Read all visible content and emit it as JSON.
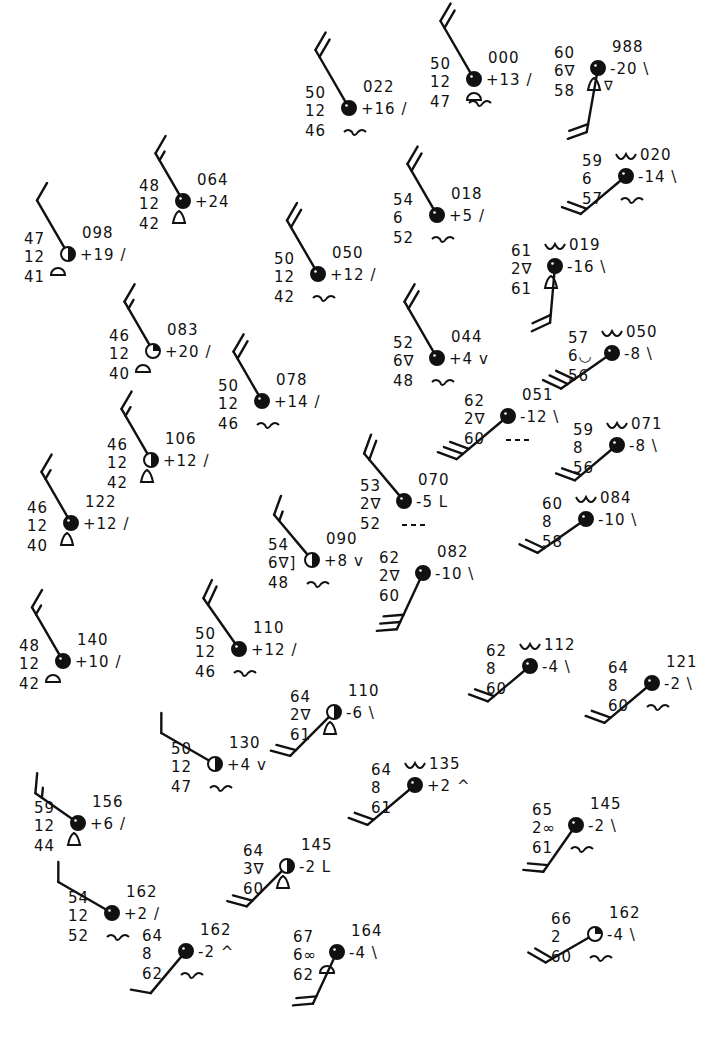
{
  "figure": {
    "type": "surface-station-plot"
  },
  "stations": [
    {
      "id": "s1",
      "x": 349,
      "y": 108,
      "temp": "50",
      "vis": "12",
      "dew": "46",
      "pres": "022",
      "tend": "+16",
      "tsym": "/",
      "cover": "full",
      "wind": {
        "dir": 330,
        "len": 60,
        "barbs": [
          1,
          1
        ]
      },
      "wx": "",
      "low": "wave",
      "mid": ""
    },
    {
      "id": "s2",
      "x": 474,
      "y": 79,
      "temp": "50",
      "vis": "12",
      "dew": "47",
      "pres": "000",
      "tend": "+13",
      "tsym": "/",
      "cover": "full",
      "wind": {
        "dir": 330,
        "len": 60,
        "barbs": [
          1,
          1
        ]
      },
      "wx": "",
      "low": "wave",
      "mid": "dome"
    },
    {
      "id": "s3",
      "x": 598,
      "y": 68,
      "temp": "60",
      "vis": "6∇",
      "dew": "58",
      "pres": "988",
      "tend": "-20",
      "tsym": "\\",
      "cover": "full",
      "wind": {
        "dir": 190,
        "len": 58,
        "barbs": [
          1,
          1
        ]
      },
      "wx": "",
      "low": "",
      "mid": "bell-drop"
    },
    {
      "id": "s4",
      "x": 183,
      "y": 201,
      "temp": "48",
      "vis": "12",
      "dew": "42",
      "pres": "064",
      "tend": "+24",
      "tsym": "",
      "cover": "threequarter",
      "wind": {
        "dir": 330,
        "len": 48,
        "barbs": [
          1,
          0.5
        ]
      },
      "wx": "",
      "low": "",
      "mid": "bell"
    },
    {
      "id": "s5",
      "x": 68,
      "y": 254,
      "temp": "47",
      "vis": "12",
      "dew": "41",
      "pres": "098",
      "tend": "+19",
      "tsym": "/",
      "cover": "half",
      "wind": {
        "dir": 330,
        "len": 55,
        "barbs": [
          1
        ]
      },
      "wx": "",
      "low": "",
      "mid": "dome-l"
    },
    {
      "id": "s6",
      "x": 437,
      "y": 215,
      "temp": "54",
      "vis": "6",
      "dew": "52",
      "pres": "018",
      "tend": "+5",
      "tsym": "/",
      "cover": "full",
      "wind": {
        "dir": 330,
        "len": 52,
        "barbs": [
          1,
          1
        ]
      },
      "wx": "",
      "low": "wave",
      "mid": ""
    },
    {
      "id": "s7",
      "x": 626,
      "y": 176,
      "temp": "59",
      "vis": "6",
      "dew": "57",
      "pres": "020",
      "tend": "-14",
      "tsym": "\\",
      "cover": "full",
      "wind": {
        "dir": 230,
        "len": 52,
        "barbs": [
          1,
          1
        ]
      },
      "wx": "",
      "low": "wave",
      "mid": "",
      "high": "ww"
    },
    {
      "id": "s8",
      "x": 318,
      "y": 274,
      "temp": "50",
      "vis": "12",
      "dew": "42",
      "pres": "050",
      "tend": "+12",
      "tsym": "/",
      "cover": "full",
      "wind": {
        "dir": 330,
        "len": 55,
        "barbs": [
          1,
          1
        ]
      },
      "wx": "",
      "low": "wave",
      "mid": ""
    },
    {
      "id": "s9",
      "x": 555,
      "y": 266,
      "temp": "61",
      "vis": "2∇",
      "dew": "61",
      "pres": "019",
      "tend": "-16",
      "tsym": "\\",
      "cover": "full",
      "wind": {
        "dir": 185,
        "len": 50,
        "barbs": [
          1,
          1
        ]
      },
      "wx": "",
      "low": "",
      "mid": "bell",
      "high": "ww"
    },
    {
      "id": "s10",
      "x": 153,
      "y": 351,
      "temp": "46",
      "vis": "12",
      "dew": "40",
      "pres": "083",
      "tend": "+20",
      "tsym": "/",
      "cover": "quarter",
      "wind": {
        "dir": 330,
        "len": 50,
        "barbs": [
          1,
          0.5
        ]
      },
      "wx": "",
      "low": "",
      "mid": "dome-l"
    },
    {
      "id": "s11",
      "x": 437,
      "y": 358,
      "temp": "52",
      "vis": "6∇",
      "dew": "48",
      "pres": "044",
      "tend": "+4",
      "tsym": "v",
      "cover": "full",
      "wind": {
        "dir": 330,
        "len": 58,
        "barbs": [
          1,
          1
        ]
      },
      "wx": "",
      "low": "wave",
      "mid": ""
    },
    {
      "id": "s12",
      "x": 612,
      "y": 353,
      "temp": "57",
      "vis": "6◡",
      "dew": "56",
      "pres": "050",
      "tend": "-8",
      "tsym": "\\",
      "cover": "full",
      "wind": {
        "dir": 235,
        "len": 55,
        "barbs": [
          1,
          1,
          1
        ]
      },
      "wx": "",
      "low": "",
      "mid": "",
      "high": "ww"
    },
    {
      "id": "s13",
      "x": 262,
      "y": 401,
      "temp": "50",
      "vis": "12",
      "dew": "46",
      "pres": "078",
      "tend": "+14",
      "tsym": "/",
      "cover": "full",
      "wind": {
        "dir": 330,
        "len": 50,
        "barbs": [
          1,
          1
        ]
      },
      "wx": "",
      "low": "wave",
      "mid": ""
    },
    {
      "id": "s14",
      "x": 508,
      "y": 416,
      "temp": "62",
      "vis": "2∇",
      "dew": "60",
      "pres": "051",
      "tend": "-12",
      "tsym": "\\",
      "cover": "full",
      "wind": {
        "dir": 230,
        "len": 60,
        "barbs": [
          1,
          1,
          1
        ]
      },
      "wx": "",
      "low": "dashes",
      "mid": ""
    },
    {
      "id": "s15",
      "x": 617,
      "y": 445,
      "temp": "59",
      "vis": "8",
      "dew": "56",
      "pres": "071",
      "tend": "-8",
      "tsym": "\\",
      "cover": "full",
      "wind": {
        "dir": 230,
        "len": 48,
        "barbs": [
          1,
          1
        ]
      },
      "wx": "",
      "low": "",
      "mid": "",
      "high": "ww"
    },
    {
      "id": "s16",
      "x": 151,
      "y": 460,
      "temp": "46",
      "vis": "12",
      "dew": "42",
      "pres": "106",
      "tend": "+12",
      "tsym": "/",
      "cover": "half",
      "wind": {
        "dir": 330,
        "len": 52,
        "barbs": [
          1,
          0.5
        ]
      },
      "wx": "",
      "low": "",
      "mid": "bell"
    },
    {
      "id": "s17",
      "x": 404,
      "y": 501,
      "temp": "53",
      "vis": "2∇",
      "dew": "52",
      "pres": "070",
      "tend": "-5",
      "tsym": "L",
      "cover": "full",
      "wind": {
        "dir": 320,
        "len": 55,
        "barbs": [
          1,
          1
        ]
      },
      "wx": "",
      "low": "dashes",
      "mid": ""
    },
    {
      "id": "s18",
      "x": 586,
      "y": 519,
      "temp": "60",
      "vis": "8",
      "dew": "58",
      "pres": "084",
      "tend": "-10",
      "tsym": "\\",
      "cover": "full",
      "wind": {
        "dir": 235,
        "len": 52,
        "barbs": [
          1,
          1
        ]
      },
      "wx": "",
      "low": "",
      "mid": "",
      "high": "ww"
    },
    {
      "id": "s19",
      "x": 71,
      "y": 523,
      "temp": "46",
      "vis": "12",
      "dew": "40",
      "pres": "122",
      "tend": "+12",
      "tsym": "/",
      "cover": "full",
      "wind": {
        "dir": 330,
        "len": 52,
        "barbs": [
          1,
          0.5
        ]
      },
      "wx": "",
      "low": "",
      "mid": "bell"
    },
    {
      "id": "s20",
      "x": 312,
      "y": 560,
      "temp": "54",
      "vis": "6∇]",
      "dew": "48",
      "pres": "090",
      "tend": "+8",
      "tsym": "v",
      "cover": "half",
      "wind": {
        "dir": 320,
        "len": 52,
        "barbs": [
          1,
          0.5
        ]
      },
      "wx": "",
      "low": "wave",
      "mid": ""
    },
    {
      "id": "s21",
      "x": 423,
      "y": 573,
      "temp": "62",
      "vis": "2∇",
      "dew": "60",
      "pres": "082",
      "tend": "-10",
      "tsym": "\\",
      "cover": "full",
      "wind": {
        "dir": 205,
        "len": 55,
        "barbs": [
          1,
          1,
          1
        ]
      },
      "wx": "",
      "low": "",
      "mid": ""
    },
    {
      "id": "s22",
      "x": 63,
      "y": 661,
      "temp": "48",
      "vis": "12",
      "dew": "42",
      "pres": "140",
      "tend": "+10",
      "tsym": "/",
      "cover": "full",
      "wind": {
        "dir": 330,
        "len": 55,
        "barbs": [
          1,
          0.5
        ]
      },
      "wx": "",
      "low": "",
      "mid": "dome-l"
    },
    {
      "id": "s23",
      "x": 239,
      "y": 649,
      "temp": "50",
      "vis": "12",
      "dew": "46",
      "pres": "110",
      "tend": "+12",
      "tsym": "/",
      "cover": "full",
      "wind": {
        "dir": 325,
        "len": 55,
        "barbs": [
          1,
          1
        ]
      },
      "wx": "",
      "low": "wave",
      "mid": ""
    },
    {
      "id": "s24",
      "x": 530,
      "y": 666,
      "temp": "62",
      "vis": "8",
      "dew": "60",
      "pres": "112",
      "tend": "-4",
      "tsym": "\\",
      "cover": "full",
      "wind": {
        "dir": 230,
        "len": 48,
        "barbs": [
          1,
          1
        ]
      },
      "wx": "",
      "low": "",
      "mid": "",
      "high": "ww"
    },
    {
      "id": "s25",
      "x": 652,
      "y": 683,
      "temp": "64",
      "vis": "8",
      "dew": "60",
      "pres": "121",
      "tend": "-2",
      "tsym": "\\",
      "cover": "full",
      "wind": {
        "dir": 230,
        "len": 55,
        "barbs": [
          1,
          1
        ]
      },
      "wx": "",
      "low": "wave",
      "mid": ""
    },
    {
      "id": "s26",
      "x": 334,
      "y": 712,
      "temp": "64",
      "vis": "2∇",
      "dew": "61",
      "pres": "110",
      "tend": "-6",
      "tsym": "\\",
      "cover": "half",
      "wind": {
        "dir": 225,
        "len": 55,
        "barbs": [
          1,
          1
        ]
      },
      "wx": "",
      "low": "",
      "mid": "bell"
    },
    {
      "id": "s27",
      "x": 215,
      "y": 764,
      "temp": "50",
      "vis": "12",
      "dew": "47",
      "pres": "130",
      "tend": "+4",
      "tsym": "v",
      "cover": "half",
      "wind": {
        "dir": 300,
        "len": 55,
        "barbs": [
          1
        ]
      },
      "wx": "",
      "low": "wave",
      "mid": ""
    },
    {
      "id": "s28",
      "x": 415,
      "y": 785,
      "temp": "64",
      "vis": "8",
      "dew": "61",
      "pres": "135",
      "tend": "+2",
      "tsym": "^",
      "cover": "full",
      "wind": {
        "dir": 230,
        "len": 55,
        "barbs": [
          1,
          1
        ]
      },
      "wx": "",
      "low": "",
      "mid": "",
      "high": "ww"
    },
    {
      "id": "s29",
      "x": 78,
      "y": 823,
      "temp": "59",
      "vis": "12",
      "dew": "44",
      "pres": "156",
      "tend": "+6",
      "tsym": "/",
      "cover": "full",
      "wind": {
        "dir": 305,
        "len": 45,
        "barbs": [
          1,
          0.5
        ]
      },
      "wx": "",
      "low": "",
      "mid": "bell"
    },
    {
      "id": "s30",
      "x": 576,
      "y": 825,
      "temp": "65",
      "vis": "2∞",
      "dew": "61",
      "pres": "145",
      "tend": "-2",
      "tsym": "\\",
      "cover": "full",
      "wind": {
        "dir": 215,
        "len": 50,
        "barbs": [
          1,
          1
        ]
      },
      "wx": "",
      "low": "wave",
      "mid": ""
    },
    {
      "id": "s31",
      "x": 287,
      "y": 866,
      "temp": "64",
      "vis": "3∇",
      "dew": "60",
      "pres": "145",
      "tend": "-2",
      "tsym": "L",
      "cover": "half",
      "wind": {
        "dir": 225,
        "len": 50,
        "barbs": [
          1,
          1
        ]
      },
      "wx": "",
      "low": "",
      "mid": "bell"
    },
    {
      "id": "s32",
      "x": 112,
      "y": 913,
      "temp": "54",
      "vis": "12",
      "dew": "52",
      "pres": "162",
      "tend": "+2",
      "tsym": "/",
      "cover": "full",
      "wind": {
        "dir": 300,
        "len": 55,
        "barbs": [
          1
        ]
      },
      "wx": "",
      "low": "wave",
      "mid": ""
    },
    {
      "id": "s33",
      "x": 186,
      "y": 951,
      "temp": "64",
      "vis": "8",
      "dew": "62",
      "pres": "162",
      "tend": "-2",
      "tsym": "^",
      "cover": "full",
      "wind": {
        "dir": 220,
        "len": 48,
        "barbs": [
          1
        ]
      },
      "wx": "",
      "low": "wave",
      "mid": ""
    },
    {
      "id": "s34",
      "x": 337,
      "y": 952,
      "temp": "67",
      "vis": "6∞",
      "dew": "62",
      "pres": "164",
      "tend": "-4",
      "tsym": "\\",
      "cover": "full",
      "wind": {
        "dir": 205,
        "len": 50,
        "barbs": [
          1,
          1
        ]
      },
      "wx": "",
      "low": "",
      "mid": "dome-l"
    },
    {
      "id": "s35",
      "x": 595,
      "y": 934,
      "temp": "66",
      "vis": "2",
      "dew": "60",
      "pres": "162",
      "tend": "-4",
      "tsym": "\\",
      "cover": "quarter",
      "wind": {
        "dir": 240,
        "len": 50,
        "barbs": [
          1,
          1
        ]
      },
      "wx": "",
      "low": "wave",
      "mid": ""
    }
  ],
  "caption": "Surface station plots with temperature, dew point, visibility, pressure, pressure tendency, wind and cloud symbols"
}
